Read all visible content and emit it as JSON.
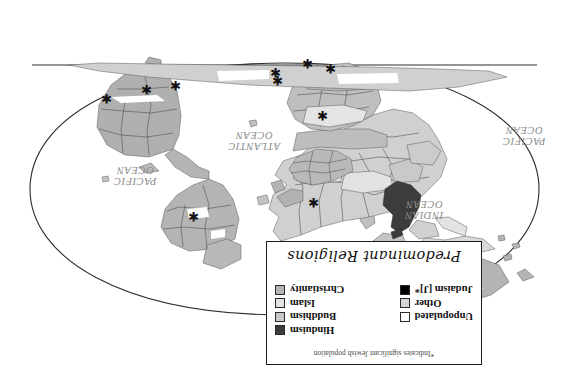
{
  "figure": {
    "orientation_note": "whole figure printed upside-down (rotated 180 degrees)",
    "title": "Predominant Religions"
  },
  "legend": {
    "title": "Predominant Religions",
    "footnote": "*Indicates significant Jewish population",
    "columns": [
      {
        "name": "religions-column",
        "entries": [
          {
            "label": "Christianity",
            "color": "#b4b4b4"
          },
          {
            "label": "Islam",
            "color": "#e2e2e2"
          },
          {
            "label": "Buddhism",
            "color": "#c9c9c9"
          },
          {
            "label": "Hinduism",
            "color": "#3c3c3c"
          }
        ]
      },
      {
        "name": "other-column",
        "entries": [
          {
            "label": "Judaism [J]*",
            "color": "#000000"
          },
          {
            "label": "Other",
            "color": "#d4d4d4"
          },
          {
            "label": "Unpopulated",
            "color": "#ffffff"
          }
        ]
      }
    ]
  },
  "map": {
    "projection": "oval (Robinson-like) world projection",
    "ocean_labels": [
      {
        "name": "pacific-ocean-left",
        "text": "PACIFIC\nOCEAN",
        "x": 44,
        "y": 236
      },
      {
        "name": "indian-ocean",
        "text": "INDIAN\nOCEAN",
        "x": 143,
        "y": 162
      },
      {
        "name": "atlantic-ocean",
        "text": "ATLANTIC\nOCEAN",
        "x": 312,
        "y": 231
      },
      {
        "name": "pacific-ocean-right",
        "text": "PACIFIC\nOCEAN",
        "x": 432,
        "y": 196
      }
    ],
    "jewish_population_markers": [
      {
        "region": "north-america-east",
        "x": 370,
        "y": 161
      },
      {
        "region": "south-america",
        "x": 388,
        "y": 292
      },
      {
        "region": "south-america-west",
        "x": 417,
        "y": 288
      },
      {
        "region": "south-america-east",
        "x": 457,
        "y": 279
      },
      {
        "region": "europe-north",
        "x": 250,
        "y": 175
      },
      {
        "region": "europe-central",
        "x": 241,
        "y": 262
      },
      {
        "region": "africa-south",
        "x": 233,
        "y": 309
      },
      {
        "region": "africa-east",
        "x": 256,
        "y": 314
      },
      {
        "region": "middle-east",
        "x": 286,
        "y": 297
      },
      {
        "region": "asia-southeast",
        "x": 288,
        "y": 305
      }
    ],
    "colors": {
      "christianity": "#b4b4b4",
      "islam": "#e2e2e2",
      "buddhism": "#c9c9c9",
      "hinduism": "#3c3c3c",
      "judaism": "#000000",
      "other": "#d4d4d4",
      "unpopulated": "#ffffff",
      "outline": "#4a4a4a",
      "border": "#1b1b1b"
    }
  }
}
